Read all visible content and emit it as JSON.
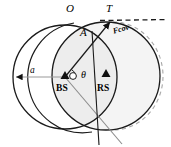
{
  "figure": {
    "background_color": "#ffffff",
    "width": 171,
    "height": 147,
    "labels": {
      "point_o": "O",
      "point_t": "T",
      "point_a": "A",
      "radius_a": "a",
      "angle_theta": "θ",
      "base_station": "BS",
      "relay_station": "RS",
      "coverage_region": "Fcov"
    },
    "colors": {
      "stroke": "#1a1a1a",
      "shade_fill": "#f2f2f2",
      "overlap_fill": "#e8e8e8",
      "gray_line": "#8c8c8c",
      "dashed_arc": "#a8a8a8",
      "marker": "#111111"
    },
    "geometry": {
      "bs_center": {
        "x": 65,
        "y": 77
      },
      "rs_center": {
        "x": 106,
        "y": 76
      },
      "bs_radius": 52,
      "rs_radius": 54,
      "point_o": {
        "x": 75,
        "y": 22
      },
      "point_t": {
        "x": 112,
        "y": 22
      },
      "point_a": {
        "x": 89,
        "y": 35
      },
      "dashed_line_end": {
        "x": 168,
        "y": 20
      }
    }
  }
}
